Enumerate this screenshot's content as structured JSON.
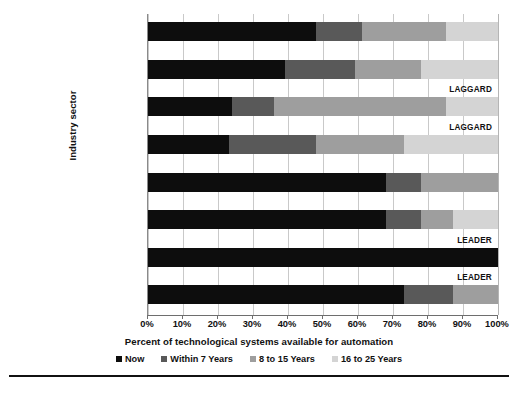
{
  "chart_data": {
    "type": "bar",
    "orientation": "horizontal",
    "stacked": true,
    "title": "",
    "xlabel": "Percent of technological systems available for automation",
    "ylabel": "Industry sector",
    "xlim": [
      0,
      100
    ],
    "grid": true,
    "legend_position": "bottom",
    "xtick_labels": [
      "0%",
      "10%",
      "20%",
      "30%",
      "40%",
      "50%",
      "60%",
      "70%",
      "80%",
      "90%",
      "100%"
    ],
    "xtick_values": [
      0,
      10,
      20,
      30,
      40,
      50,
      60,
      70,
      80,
      90,
      100
    ],
    "categories": [
      "Agriculture",
      "Manufacturing",
      "Construction",
      "Transportation",
      "Accom. and food",
      "Health care",
      "Admin. and support",
      "Educational services"
    ],
    "series": [
      {
        "name": "Now",
        "color": "#0d0d0d",
        "values": [
          48,
          39,
          24,
          23,
          68,
          68,
          100,
          73
        ]
      },
      {
        "name": "Within 7 Years",
        "color": "#595959",
        "values": [
          13,
          20,
          12,
          25,
          10,
          10,
          0,
          14
        ]
      },
      {
        "name": "8 to 15 Years",
        "color": "#9e9e9e",
        "values": [
          24,
          19,
          49,
          25,
          22,
          9,
          0,
          13
        ]
      },
      {
        "name": "16 to 25 Years",
        "color": "#d4d4d4",
        "values": [
          15,
          22,
          15,
          27,
          0,
          13,
          0,
          0
        ]
      }
    ],
    "annotations": [
      {
        "category": "Construction",
        "text": "LAGGARD"
      },
      {
        "category": "Transportation",
        "text": "LAGGARD"
      },
      {
        "category": "Admin. and support",
        "text": "LEADER"
      },
      {
        "category": "Educational services",
        "text": "LEADER"
      }
    ]
  },
  "caption": {
    "rule": true,
    "text": ""
  }
}
